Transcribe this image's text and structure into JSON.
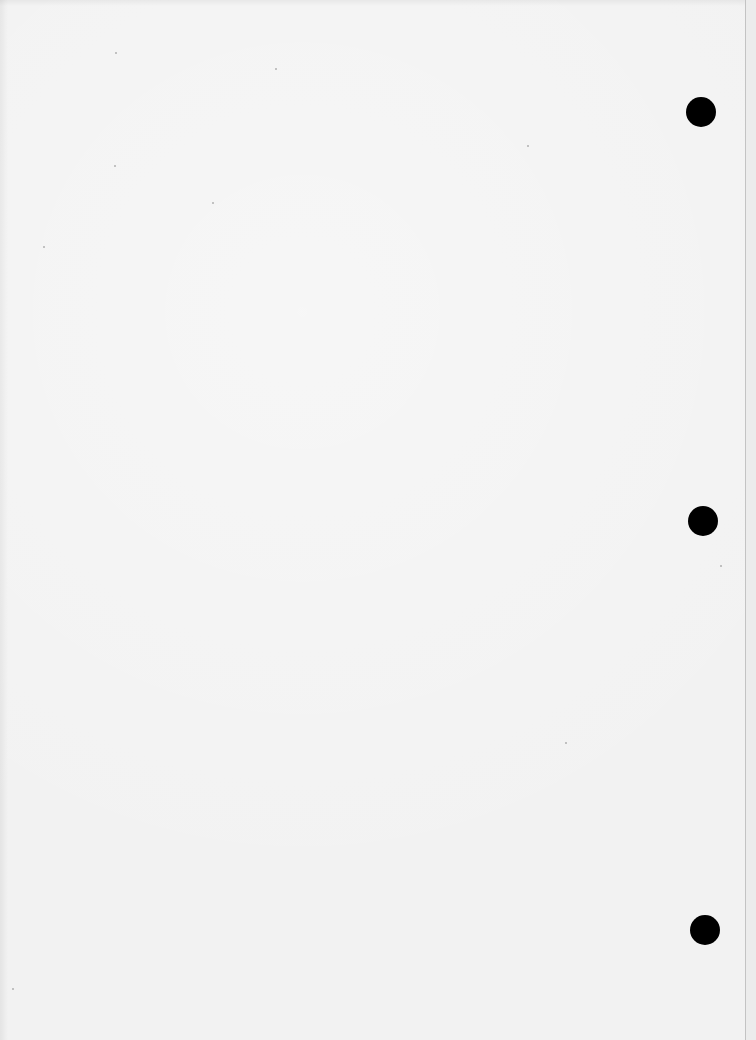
{
  "document": {
    "type": "blank scanned page",
    "background_color": "#f2f2f2",
    "text": ""
  },
  "punch_holes": [
    {
      "cx": 701,
      "cy": 112,
      "r": 15
    },
    {
      "cx": 703,
      "cy": 521,
      "r": 15
    },
    {
      "cx": 705,
      "cy": 930,
      "r": 15
    }
  ],
  "edge": {
    "line_x": 745
  }
}
